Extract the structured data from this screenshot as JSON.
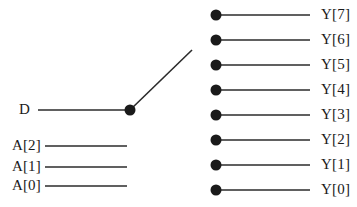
{
  "diagram": {
    "colors": {
      "stroke": "#2b2b2b",
      "node_fill": "#1a1a1a",
      "text": "#1a1a1a",
      "background": "#ffffff"
    },
    "data_input": {
      "label": "D",
      "label_x": 30,
      "label_y": 110,
      "wire": {
        "x1": 38,
        "y1": 110,
        "x2": 130,
        "y2": 110
      }
    },
    "pivot_node": {
      "name": "switch-pivot",
      "cx": 130,
      "cy": 110,
      "r": 5.5
    },
    "switch_arm": {
      "name": "switch-arm",
      "x1": 130,
      "y1": 110,
      "x2": 192,
      "y2": 50,
      "selected_output": "Y[6]"
    },
    "address_inputs": [
      {
        "label": "A[2]",
        "label_x": 41,
        "label_y": 146,
        "wire": {
          "x1": 45,
          "y1": 146,
          "x2": 127,
          "y2": 146
        }
      },
      {
        "label": "A[1]",
        "label_x": 41,
        "label_y": 167,
        "wire": {
          "x1": 45,
          "y1": 167,
          "x2": 127,
          "y2": 167
        }
      },
      {
        "label": "A[0]",
        "label_x": 41,
        "label_y": 186,
        "wire": {
          "x1": 45,
          "y1": 186,
          "x2": 127,
          "y2": 186
        }
      }
    ],
    "outputs": [
      {
        "label": "Y[7]",
        "cx": 216,
        "cy": 15,
        "r": 5.5,
        "wire": {
          "x1": 216,
          "y1": 15,
          "x2": 310,
          "y2": 15
        },
        "label_x": 321,
        "label_y": 15
      },
      {
        "label": "Y[6]",
        "cx": 216,
        "cy": 40,
        "r": 5.5,
        "wire": {
          "x1": 216,
          "y1": 40,
          "x2": 310,
          "y2": 40
        },
        "label_x": 321,
        "label_y": 40
      },
      {
        "label": "Y[5]",
        "cx": 216,
        "cy": 65,
        "r": 5.5,
        "wire": {
          "x1": 216,
          "y1": 65,
          "x2": 310,
          "y2": 65
        },
        "label_x": 321,
        "label_y": 65
      },
      {
        "label": "Y[4]",
        "cx": 216,
        "cy": 90,
        "r": 5.5,
        "wire": {
          "x1": 216,
          "y1": 90,
          "x2": 310,
          "y2": 90
        },
        "label_x": 321,
        "label_y": 90
      },
      {
        "label": "Y[3]",
        "cx": 216,
        "cy": 115,
        "r": 5.5,
        "wire": {
          "x1": 216,
          "y1": 115,
          "x2": 310,
          "y2": 115
        },
        "label_x": 321,
        "label_y": 115
      },
      {
        "label": "Y[2]",
        "cx": 216,
        "cy": 140,
        "r": 5.5,
        "wire": {
          "x1": 216,
          "y1": 140,
          "x2": 310,
          "y2": 140
        },
        "label_x": 321,
        "label_y": 140
      },
      {
        "label": "Y[1]",
        "cx": 216,
        "cy": 165,
        "r": 5.5,
        "wire": {
          "x1": 216,
          "y1": 165,
          "x2": 310,
          "y2": 165
        },
        "label_x": 321,
        "label_y": 165
      },
      {
        "label": "Y[0]",
        "cx": 216,
        "cy": 190,
        "r": 5.5,
        "wire": {
          "x1": 216,
          "y1": 190,
          "x2": 310,
          "y2": 190
        },
        "label_x": 321,
        "label_y": 190
      }
    ]
  }
}
